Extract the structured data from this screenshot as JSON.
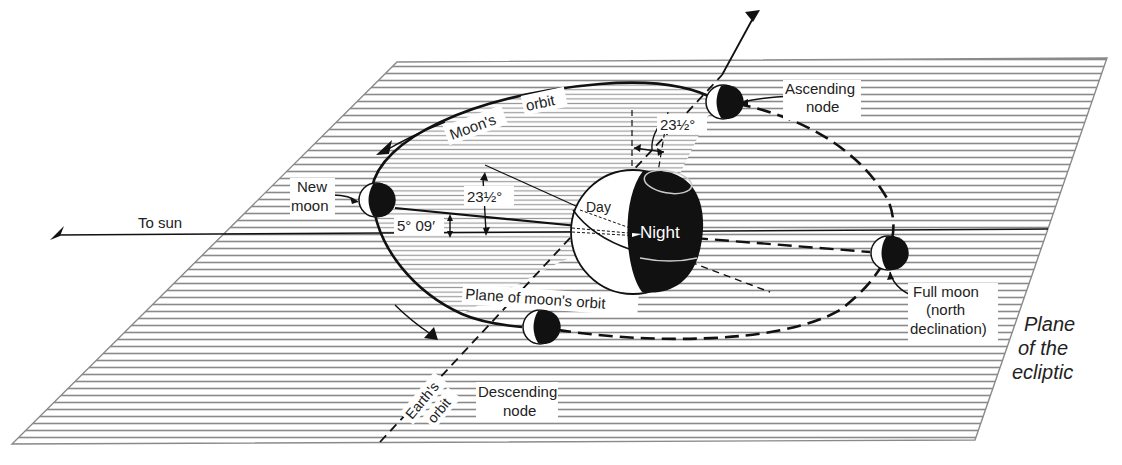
{
  "diagram": {
    "type": "astronomy-orbit-illustration",
    "labels": {
      "moons_orbit_1": "Moon's",
      "moons_orbit_2": "orbit",
      "new_moon_1": "New",
      "new_moon_2": "moon",
      "to_sun": "To sun",
      "angle_5_09": "5° 09′",
      "angle_23_left": "23½°",
      "angle_23_top": "23½°",
      "day": "Day",
      "night": "Night",
      "ascending_node_1": "Ascending",
      "ascending_node_2": "node",
      "descending_node_1": "Descending",
      "descending_node_2": "node",
      "full_moon_1": "Full moon",
      "full_moon_2": "(north",
      "full_moon_3": "declination)",
      "plane_moons_orbit": "Plane of moon's orbit",
      "earths_orbit_1": "Earth's",
      "earths_orbit_2": "orbit",
      "plane_ecliptic_1": "Plane",
      "plane_ecliptic_2": "of the",
      "plane_ecliptic_3": "ecliptic"
    },
    "colors": {
      "ink": "#111111",
      "hatch": "#8a8a8a",
      "background": "#ffffff"
    }
  }
}
